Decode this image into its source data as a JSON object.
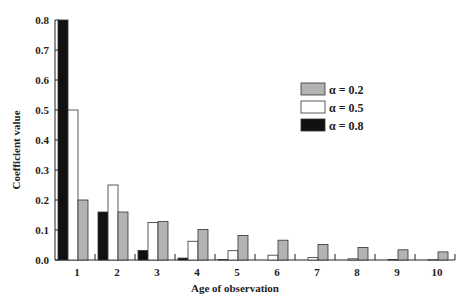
{
  "chart_data": {
    "type": "bar",
    "title": "",
    "xlabel": "Age of observation",
    "ylabel": "Coefficient value",
    "ylim": [
      0,
      0.8
    ],
    "yticks": [
      "0.0",
      "0.1",
      "0.2",
      "0.3",
      "0.4",
      "0.5",
      "0.6",
      "0.7",
      "0.8"
    ],
    "categories": [
      "1",
      "2",
      "3",
      "4",
      "5",
      "6",
      "7",
      "8",
      "9",
      "10"
    ],
    "grid": false,
    "legend_position": "right",
    "series": [
      {
        "name": "α = 0.8",
        "color": "#111111",
        "values": [
          0.8,
          0.16,
          0.032,
          0.0064,
          0.0013,
          0.0003,
          0.0001,
          0.0,
          0.0,
          0.0
        ]
      },
      {
        "name": "α = 0.5",
        "color": "#ffffff",
        "values": [
          0.5,
          0.25,
          0.125,
          0.0625,
          0.031,
          0.016,
          0.008,
          0.004,
          0.002,
          0.001
        ]
      },
      {
        "name": "α = 0.2",
        "color": "#b3b3b3",
        "values": [
          0.2,
          0.16,
          0.128,
          0.102,
          0.082,
          0.066,
          0.052,
          0.042,
          0.034,
          0.027
        ]
      }
    ],
    "legend": [
      "α = 0.2",
      "α = 0.5",
      "α = 0.8"
    ]
  }
}
